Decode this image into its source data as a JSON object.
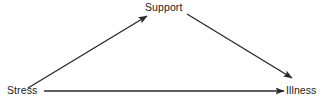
{
  "diagram": {
    "type": "path-diagram",
    "background_color": "#ffffff",
    "line_color": "#2a2a2a",
    "text_color": "#1a1a1a",
    "nodes": [
      {
        "id": "stress",
        "label": "Stress",
        "x": 7,
        "y": 84
      },
      {
        "id": "support",
        "label": "Support",
        "x": 145,
        "y": 1
      },
      {
        "id": "illness",
        "label": "Illness",
        "x": 286,
        "y": 84
      }
    ],
    "edges": [
      {
        "id": "stress-to-support",
        "from": "stress",
        "to": "support",
        "arrowhead": "end",
        "x1": 28,
        "y1": 88,
        "x2": 147,
        "y2": 16
      },
      {
        "id": "support-to-illness",
        "from": "support",
        "to": "illness",
        "arrowhead": "end",
        "x1": 187,
        "y1": 14,
        "x2": 292,
        "y2": 78
      },
      {
        "id": "stress-to-illness",
        "from": "stress",
        "to": "illness",
        "arrowhead": "end",
        "x1": 44,
        "y1": 91,
        "x2": 284,
        "y2": 91
      }
    ]
  }
}
